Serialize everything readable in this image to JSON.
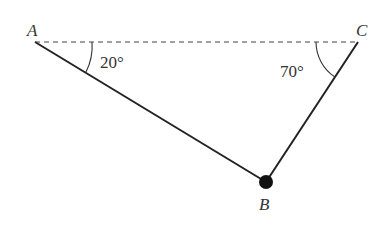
{
  "diagram": {
    "points": {
      "A": {
        "label": "A",
        "x": 35,
        "y": 42
      },
      "B": {
        "label": "B",
        "x": 266,
        "y": 182
      },
      "C": {
        "label": "C",
        "x": 358,
        "y": 42
      }
    },
    "angles": {
      "at_A": "20°",
      "at_C": "70°"
    },
    "segments": [
      {
        "from": "A",
        "to": "C",
        "style": "dashed"
      },
      {
        "from": "A",
        "to": "B",
        "style": "solid"
      },
      {
        "from": "C",
        "to": "B",
        "style": "solid"
      }
    ]
  }
}
